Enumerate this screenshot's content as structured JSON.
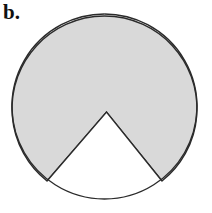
{
  "figure": {
    "label": "b.",
    "background_color": "#ffffff",
    "shaded_fill_color": "#d9d9d9",
    "unshaded_fill_color": "#ffffff",
    "outline_color": "#2b2b2b",
    "outline_width": 1.4
  },
  "geometry": {
    "type": "circle-with-sector-notch",
    "circle": {
      "center_x": 104.5,
      "center_y": 106.5,
      "radius": 92.5
    },
    "notch": {
      "apex_x": 106.5,
      "apex_y": 112.0,
      "left_point_x": 47.0,
      "left_point_y": 181.0,
      "right_point_x": 162.0,
      "right_point_y": 181.0,
      "half_angle_degrees": 40,
      "sector_angle_degrees": 80
    },
    "shaded_arc_degrees": 280
  },
  "paths": {
    "circle_outline": "M 104.5 14 A 92.5 92.5 0 1 1 104.4 14",
    "shaded_region": "M 47 181 A 92.5 92.5 0 1 1 162 181 L 106.5 112 Z",
    "notch_region": "M 47 181 L 106.5 112 L 162 181 A 92.5 92.5 0 0 1 47 181 Z",
    "notch_edges": "M 47 181 L 106.5 112 L 162 181"
  }
}
